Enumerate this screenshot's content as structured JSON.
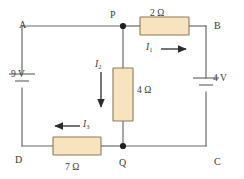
{
  "figure": {
    "background_color": "#ffffff",
    "wire_color": "#6b6b6b",
    "resistor_fill": "#f7e3bd",
    "resistor_stroke": "#8a7a5c",
    "text_color": "#3a3a3a"
  },
  "nodes": {
    "a": "A",
    "b": "B",
    "c": "C",
    "d": "D",
    "p": "P",
    "q": "Q"
  },
  "components": {
    "resistor_top": {
      "value": "2 Ω",
      "orientation": "horizontal",
      "between": "P-B"
    },
    "resistor_middle": {
      "value": "4 Ω",
      "orientation": "vertical",
      "between": "P-Q"
    },
    "resistor_bottom": {
      "value": "7 Ω",
      "orientation": "horizontal",
      "between": "D-Q"
    },
    "battery_left": {
      "value": "9 V",
      "orientation": "vertical",
      "between": "A-D"
    },
    "battery_right": {
      "value": "4 V",
      "orientation": "vertical",
      "between": "B-C"
    }
  },
  "currents": {
    "i1": {
      "symbol": "I",
      "subscript": "1",
      "direction": "right",
      "branch": "P to B"
    },
    "i2": {
      "symbol": "I",
      "subscript": "2",
      "direction": "down",
      "branch": "P to Q"
    },
    "i3": {
      "symbol": "I",
      "subscript": "3",
      "direction": "left",
      "branch": "Q to D"
    }
  }
}
